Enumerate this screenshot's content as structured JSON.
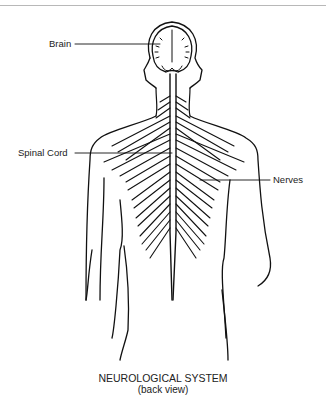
{
  "diagram": {
    "title": "NEUROLOGICAL SYSTEM",
    "subtitle": "(back view)",
    "labels": [
      {
        "id": "brain",
        "text": "Brain"
      },
      {
        "id": "spinal_cord",
        "text": "Spinal Cord"
      },
      {
        "id": "nerves",
        "text": "Nerves"
      }
    ],
    "colors": {
      "line": "#111111",
      "background": "#ffffff"
    }
  }
}
